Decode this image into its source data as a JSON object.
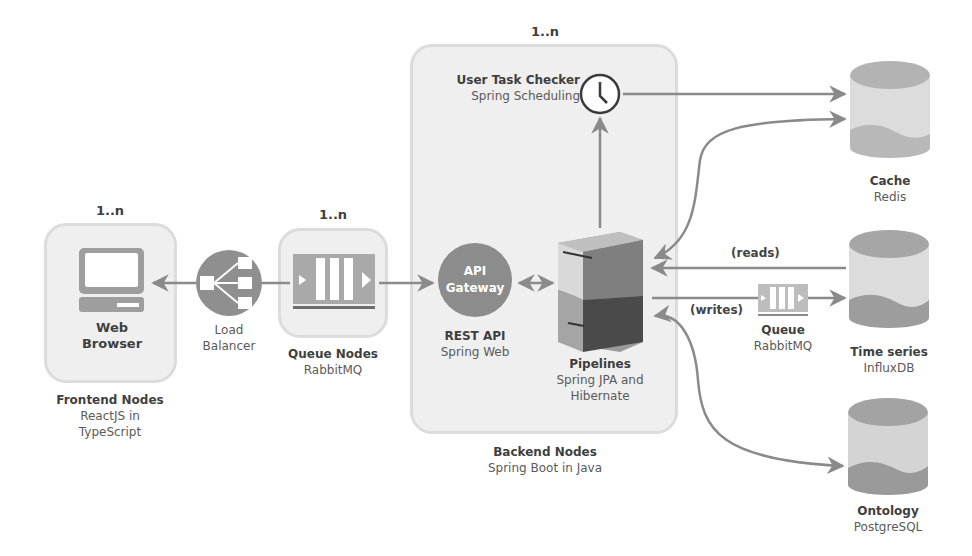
{
  "diagram": {
    "frontend": {
      "multiplicity": "1..n",
      "node_title": "Web",
      "node_title_2": "Browser",
      "group_title": "Frontend Nodes",
      "group_sub_1": "ReactJS in",
      "group_sub_2": "TypeScript",
      "icon": "computer-icon"
    },
    "load_balancer": {
      "title_1": "Load",
      "title_2": "Balancer",
      "icon": "load-balancer-icon"
    },
    "queue_nodes": {
      "multiplicity": "1..n",
      "title": "Queue Nodes",
      "subtitle": "RabbitMQ",
      "icon": "queue-icon"
    },
    "backend": {
      "multiplicity": "1..n",
      "group_title": "Backend Nodes",
      "group_sub": "Spring Boot in Java",
      "task_checker": {
        "title": "User Task Checker",
        "subtitle": "Spring Scheduling",
        "icon": "clock-icon"
      },
      "api_gateway": {
        "icon_line_1": "API",
        "icon_line_2": "Gateway",
        "title": "REST API",
        "subtitle": "Spring Web"
      },
      "pipelines": {
        "title": "Pipelines",
        "sub_1": "Spring JPA and",
        "sub_2": "Hibernate",
        "icon": "server-icon"
      }
    },
    "stores": [
      {
        "title": "Cache",
        "subtitle": "Redis",
        "icon": "database-icon"
      },
      {
        "title": "Time series",
        "subtitle": "InfluxDB",
        "icon": "database-icon"
      },
      {
        "title": "Ontology",
        "subtitle": "PostgreSQL",
        "icon": "database-icon"
      }
    ],
    "write_queue": {
      "title": "Queue",
      "subtitle": "RabbitMQ",
      "icon": "queue-icon"
    },
    "edge_labels": {
      "reads": "(reads)",
      "writes": "(writes)"
    },
    "colors": {
      "box_fill": "#efefef",
      "box_border": "#dcdcdc",
      "icon_gray": "#9a9a9a",
      "icon_dark": "#6e6e6e",
      "arrow": "#8a8a8a",
      "text_dark": "#3f3f3f"
    }
  }
}
